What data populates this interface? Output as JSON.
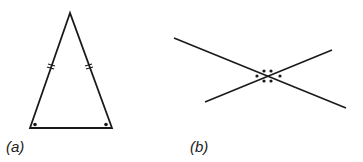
{
  "figures": [
    {
      "id": "a",
      "label": "(a)",
      "description": "Isosceles triangle with two equal sides marked by double tick marks and equal base angles marked by dots",
      "vertices": {
        "apex": [
          70,
          13
        ],
        "bottom_left": [
          30,
          128
        ],
        "bottom_right": [
          112,
          128
        ]
      },
      "equal_side_marks": 2,
      "base_angle_marks": 2
    },
    {
      "id": "b",
      "label": "(b)",
      "description": "Two intersecting straight lines with vertically opposite angles marked by dots",
      "line1": [
        [
          174,
          38
        ],
        [
          346,
          108
        ]
      ],
      "line2": [
        [
          205,
          102
        ],
        [
          332,
          50
        ]
      ],
      "intersection": [
        268,
        76
      ]
    }
  ],
  "colors": {
    "stroke": "#1a1a1a",
    "background": "#ffffff"
  }
}
